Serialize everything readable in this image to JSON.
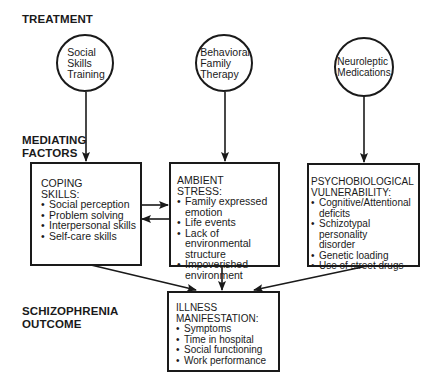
{
  "diagram": {
    "sections": {
      "treatment": "TREATMENT",
      "mediating": "MEDIATING\nFACTORS",
      "outcome": "SCHIZOPHRENIA\nOUTCOME"
    },
    "treatments": [
      {
        "id": "social-skills-training",
        "label": "Social\nSkills\nTraining"
      },
      {
        "id": "behavioral-family-therapy",
        "label": "Behavioral\nFamily\nTherapy"
      },
      {
        "id": "neuroleptic-medications",
        "label": "Neuroleptic\nMedications"
      }
    ],
    "mediating_factors": [
      {
        "id": "coping-skills",
        "title": "COPING\nSKILLS:",
        "items": [
          "Social perception",
          "Problem solving",
          "Interpersonal skills",
          "Self-care skills"
        ]
      },
      {
        "id": "ambient-stress",
        "title": "AMBIENT\nSTRESS:",
        "items": [
          "Family expressed\nemotion",
          "Life events",
          "Lack of environmental\nstructure",
          "Impoverished\nenvironment"
        ]
      },
      {
        "id": "psychobiological-vulnerability",
        "title": "PSYCHOBIOLOGICAL\nVULNERABILITY:",
        "items": [
          "Cognitive/Attentional\ndeficits",
          "Schizotypal personality\ndisorder",
          "Genetic loading",
          "Use of street drugs"
        ]
      }
    ],
    "outcome": {
      "id": "illness-manifestation",
      "title": "ILLNESS\nMANIFESTATION:",
      "items": [
        "Symptoms",
        "Time in hospital",
        "Social functioning",
        "Work performance"
      ]
    },
    "edges": [
      {
        "from": "social-skills-training",
        "to": "coping-skills"
      },
      {
        "from": "behavioral-family-therapy",
        "to": "ambient-stress"
      },
      {
        "from": "neuroleptic-medications",
        "to": "psychobiological-vulnerability"
      },
      {
        "from": "coping-skills",
        "to": "ambient-stress"
      },
      {
        "from": "ambient-stress",
        "to": "coping-skills"
      },
      {
        "from": "coping-skills",
        "to": "illness-manifestation"
      },
      {
        "from": "ambient-stress",
        "to": "illness-manifestation"
      },
      {
        "from": "psychobiological-vulnerability",
        "to": "illness-manifestation"
      }
    ]
  }
}
